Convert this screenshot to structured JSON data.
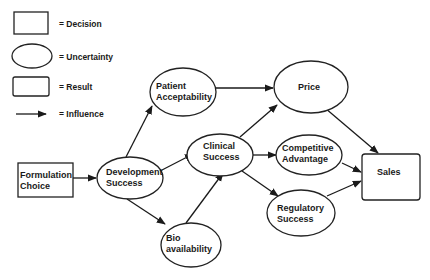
{
  "legend": {
    "decision": "= Decision",
    "uncertainty": "= Uncertainty",
    "result": "= Result",
    "influence": "= Influence"
  },
  "nodes": {
    "formulation_choice": {
      "type": "decision",
      "lines": [
        "Formulation",
        "Choice"
      ]
    },
    "development_success": {
      "type": "uncertainty",
      "lines": [
        "Development",
        "Success"
      ]
    },
    "patient_acceptability": {
      "type": "uncertainty",
      "lines": [
        "Patient",
        "Acceptability"
      ]
    },
    "bio_availability": {
      "type": "uncertainty",
      "lines": [
        "Bio",
        "availability"
      ]
    },
    "clinical_success": {
      "type": "uncertainty",
      "lines": [
        "Clinical",
        "Success"
      ]
    },
    "price": {
      "type": "uncertainty",
      "lines": [
        "Price"
      ]
    },
    "competitive_advantage": {
      "type": "uncertainty",
      "lines": [
        "Competitive",
        "Advantage"
      ]
    },
    "regulatory_success": {
      "type": "uncertainty",
      "lines": [
        "Regulatory",
        "Success"
      ]
    },
    "sales": {
      "type": "result",
      "lines": [
        "Sales"
      ]
    }
  },
  "edges": [
    [
      "formulation_choice",
      "development_success"
    ],
    [
      "development_success",
      "patient_acceptability"
    ],
    [
      "development_success",
      "clinical_success"
    ],
    [
      "development_success",
      "bio_availability"
    ],
    [
      "bio_availability",
      "clinical_success"
    ],
    [
      "patient_acceptability",
      "price"
    ],
    [
      "clinical_success",
      "price"
    ],
    [
      "clinical_success",
      "competitive_advantage"
    ],
    [
      "clinical_success",
      "regulatory_success"
    ],
    [
      "price",
      "sales"
    ],
    [
      "competitive_advantage",
      "sales"
    ],
    [
      "regulatory_success",
      "sales"
    ]
  ],
  "colors": {
    "stroke": "#222222",
    "text": "#1a1a1a",
    "background": "#ffffff"
  }
}
